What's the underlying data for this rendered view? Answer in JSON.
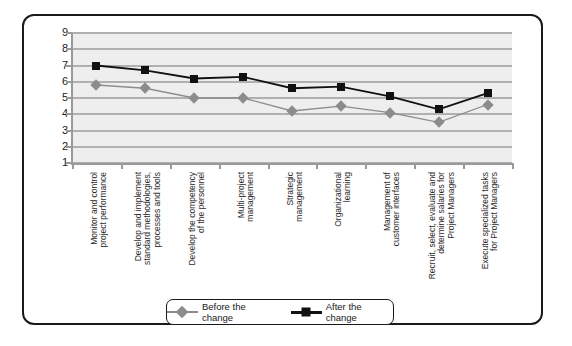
{
  "chart_data": {
    "type": "line",
    "title": "",
    "xlabel": "",
    "ylabel": "",
    "ylim": [
      1,
      9
    ],
    "yticks": [
      1,
      2,
      3,
      4,
      5,
      6,
      7,
      8,
      9
    ],
    "grid": true,
    "legend_position": "bottom",
    "categories": [
      "Monitor and control\nproject performance",
      "Develop and implement\nstandard methodologies,\nprocesses and tools",
      "Develop the competency\nof the personnel",
      "Multi-project\nmanagement",
      "Strategic\nmanagement",
      "Organizational\nlearning",
      "Management of\ncustomer interfaces",
      "Recruit, select, evaluate and\ndetermine salaries for\nProject Managers",
      "Execute specialized tasks\nfor Project Managers"
    ],
    "series": [
      {
        "name": "Before the change",
        "color": "#8c8c8c",
        "marker": "diamond",
        "values": [
          5.8,
          5.6,
          5.0,
          5.0,
          4.2,
          4.5,
          4.1,
          3.5,
          4.6
        ]
      },
      {
        "name": "After the change",
        "color": "#111111",
        "marker": "square",
        "values": [
          7.0,
          6.7,
          6.2,
          6.3,
          5.6,
          5.7,
          5.1,
          4.3,
          5.3
        ]
      }
    ]
  }
}
